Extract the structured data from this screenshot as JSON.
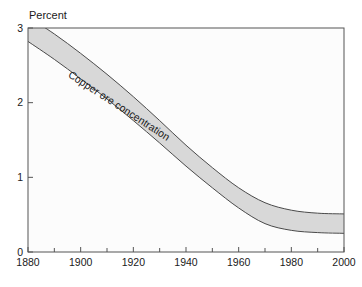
{
  "chart_data": {
    "type": "area",
    "title": "",
    "subtitle": "",
    "xlabel": "",
    "ylabel": "Percent",
    "ylabel_position": "top-left",
    "xlim": [
      1880,
      2000
    ],
    "ylim": [
      0,
      3
    ],
    "grid": false,
    "legend": false,
    "legend_position": "none",
    "plot_background": "#fcfcfc",
    "frame_color": "#555555",
    "band_fill_color": "#d8d8d8",
    "band_edge_color": "#4a4a4a",
    "y_ticks": [
      {
        "value": 0,
        "label": "0"
      },
      {
        "value": 1,
        "label": "1"
      },
      {
        "value": 2,
        "label": "2"
      },
      {
        "value": 3,
        "label": "3"
      }
    ],
    "x_ticks_major": [
      {
        "value": 1880,
        "label": "1880"
      },
      {
        "value": 1900,
        "label": "1900"
      },
      {
        "value": 1920,
        "label": "1920"
      },
      {
        "value": 1940,
        "label": "1940"
      },
      {
        "value": 1960,
        "label": "1960"
      },
      {
        "value": 1980,
        "label": "1980"
      },
      {
        "value": 2000,
        "label": "2000"
      }
    ],
    "x_ticks_minor": [
      1890,
      1910,
      1930,
      1950,
      1970,
      1990
    ],
    "annotations": [
      {
        "text": "Copper ore concentration",
        "placement": "along-band",
        "x": 1895,
        "y": 2.35,
        "rotation_deg": 33
      }
    ],
    "series": [
      {
        "name": "Copper ore concentration (upper bound)",
        "x": [
          1880,
          1890,
          1900,
          1910,
          1920,
          1930,
          1940,
          1950,
          1960,
          1970,
          1980,
          1990,
          2000
        ],
        "values": [
          3.15,
          2.92,
          2.66,
          2.38,
          2.08,
          1.76,
          1.43,
          1.13,
          0.86,
          0.66,
          0.56,
          0.52,
          0.51
        ]
      },
      {
        "name": "Copper ore concentration (lower bound)",
        "x": [
          1880,
          1890,
          1900,
          1910,
          1920,
          1930,
          1940,
          1950,
          1960,
          1970,
          1980,
          1990,
          2000
        ],
        "values": [
          2.82,
          2.58,
          2.32,
          2.05,
          1.76,
          1.46,
          1.15,
          0.86,
          0.59,
          0.38,
          0.29,
          0.26,
          0.25
        ]
      }
    ]
  }
}
